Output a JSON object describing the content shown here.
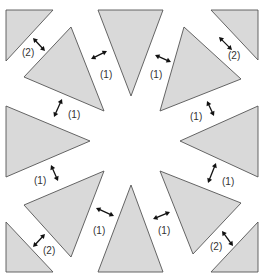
{
  "figure": {
    "width": 269,
    "height": 279,
    "colors": {
      "fill": "#d9d9d9",
      "stroke": "#555555",
      "arrow": "#111111",
      "label": "#333333",
      "background": "#ffffff"
    }
  },
  "triangles": [
    {
      "name": "corner-top-left",
      "points": [
        [
          6,
          10
        ],
        [
          53,
          10
        ],
        [
          6,
          61
        ]
      ]
    },
    {
      "name": "top-center",
      "points": [
        [
          98,
          10
        ],
        [
          163,
          10
        ],
        [
          131,
          96
        ]
      ]
    },
    {
      "name": "corner-top-right",
      "points": [
        [
          211,
          10
        ],
        [
          258,
          10
        ],
        [
          258,
          60
        ]
      ]
    },
    {
      "name": "upper-left",
      "points": [
        [
          71,
          27
        ],
        [
          104,
          111
        ],
        [
          24,
          77
        ]
      ]
    },
    {
      "name": "upper-right",
      "points": [
        [
          184,
          27
        ],
        [
          241,
          79
        ],
        [
          160,
          111
        ]
      ]
    },
    {
      "name": "left",
      "points": [
        [
          6,
          106
        ],
        [
          90,
          141
        ],
        [
          6,
          177
        ]
      ]
    },
    {
      "name": "right",
      "points": [
        [
          258,
          106
        ],
        [
          180,
          141
        ],
        [
          258,
          177
        ]
      ]
    },
    {
      "name": "lower-left",
      "points": [
        [
          24,
          205
        ],
        [
          104,
          171
        ],
        [
          71,
          257
        ]
      ]
    },
    {
      "name": "lower-right",
      "points": [
        [
          160,
          171
        ],
        [
          241,
          203
        ],
        [
          193,
          254
        ]
      ]
    },
    {
      "name": "bottom-center",
      "points": [
        [
          131,
          185
        ],
        [
          163,
          272
        ],
        [
          98,
          272
        ]
      ]
    },
    {
      "name": "corner-bottom-left",
      "points": [
        [
          6,
          222
        ],
        [
          53,
          272
        ],
        [
          6,
          272
        ]
      ]
    },
    {
      "name": "corner-bottom-right",
      "points": [
        [
          258,
          222
        ],
        [
          258,
          272
        ],
        [
          211,
          272
        ]
      ]
    }
  ],
  "gaps": [
    {
      "name": "gap-tl-corner",
      "arrow": [
        [
          33,
          38
        ],
        [
          45,
          51
        ]
      ],
      "label": "(2)",
      "label_pos": [
        22,
        56
      ]
    },
    {
      "name": "gap-tc-left",
      "arrow": [
        [
          91,
          59
        ],
        [
          107,
          51
        ]
      ],
      "label": "(1)",
      "label_pos": [
        100,
        78
      ]
    },
    {
      "name": "gap-left-upper",
      "arrow": [
        [
          62,
          99
        ],
        [
          54,
          117
        ]
      ],
      "label": "(1)",
      "label_pos": [
        68,
        118
      ]
    },
    {
      "name": "gap-tr-corner",
      "arrow": [
        [
          219,
          37
        ],
        [
          232,
          50
        ]
      ],
      "label": "(2)",
      "label_pos": [
        228,
        59
      ]
    },
    {
      "name": "gap-tc-right",
      "arrow": [
        [
          155,
          55
        ],
        [
          171,
          62
        ]
      ],
      "label": "(1)",
      "label_pos": [
        150,
        78
      ]
    },
    {
      "name": "gap-right-upper",
      "arrow": [
        [
          207,
          101
        ],
        [
          214,
          116
        ]
      ],
      "label": "(1)",
      "label_pos": [
        190,
        120
      ]
    },
    {
      "name": "gap-left-lower",
      "arrow": [
        [
          51,
          165
        ],
        [
          58,
          181
        ]
      ],
      "label": "(1)",
      "label_pos": [
        34,
        184
      ]
    },
    {
      "name": "gap-bl-corner",
      "arrow": [
        [
          45,
          234
        ],
        [
          33,
          247
        ]
      ],
      "label": "(2)",
      "label_pos": [
        43,
        254
      ]
    },
    {
      "name": "gap-bc-left",
      "arrow": [
        [
          96,
          208
        ],
        [
          114,
          216
        ]
      ],
      "label": "(1)",
      "label_pos": [
        93,
        234
      ]
    },
    {
      "name": "gap-right-lower",
      "arrow": [
        [
          216,
          163
        ],
        [
          208,
          183
        ]
      ],
      "label": "(1)",
      "label_pos": [
        222,
        185
      ]
    },
    {
      "name": "gap-bc-right",
      "arrow": [
        [
          153,
          219
        ],
        [
          170,
          212
        ]
      ],
      "label": "(1)",
      "label_pos": [
        158,
        234
      ]
    },
    {
      "name": "gap-br-corner",
      "arrow": [
        [
          222,
          231
        ],
        [
          233,
          246
        ]
      ],
      "label": "(2)",
      "label_pos": [
        210,
        250
      ]
    }
  ]
}
